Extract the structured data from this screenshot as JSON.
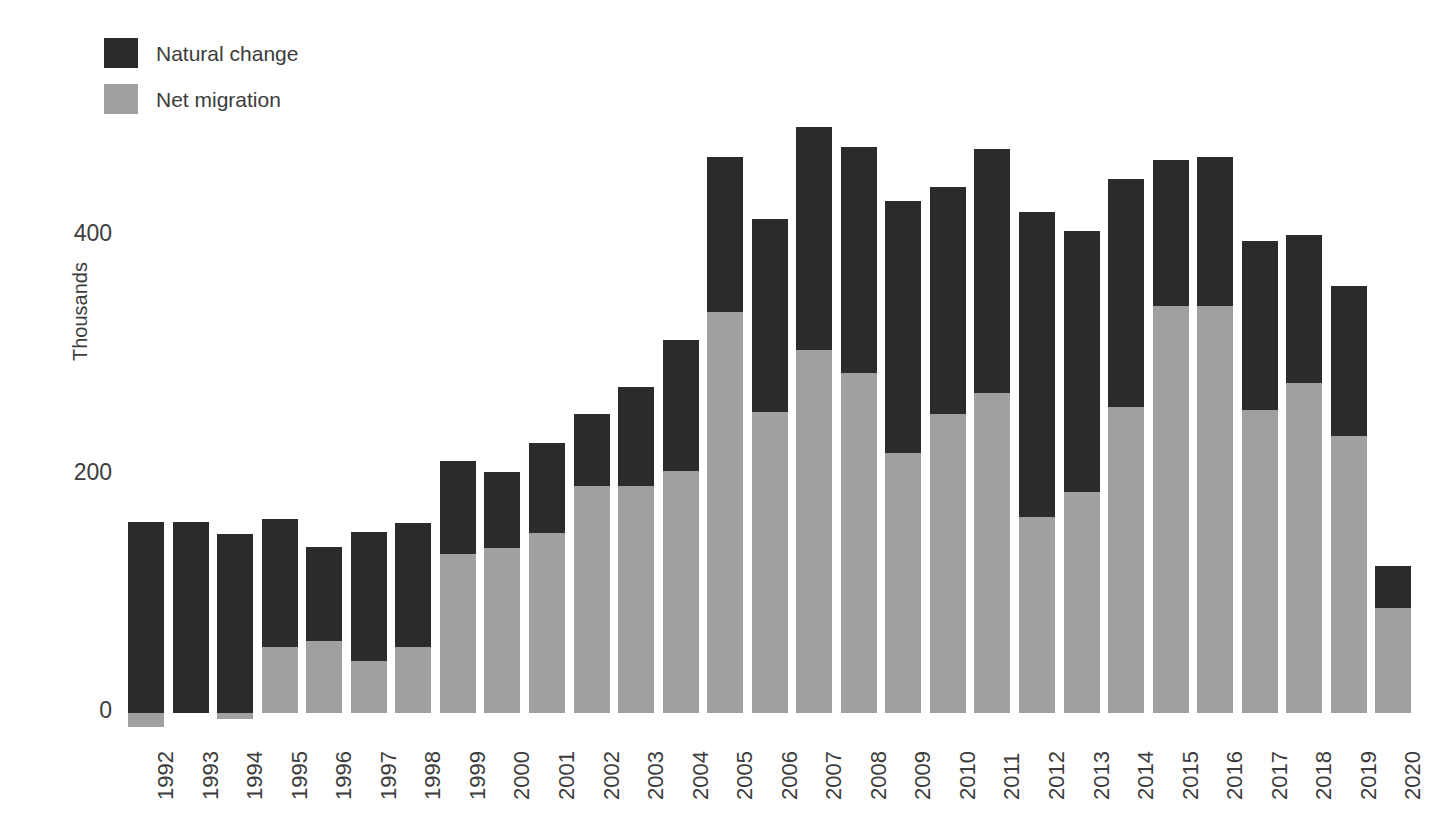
{
  "legend": {
    "position": "top-left",
    "items": [
      {
        "label": "Natural change",
        "color": "#2b2b2b",
        "key": "natural_change"
      },
      {
        "label": "Net migration",
        "color": "#a0a0a0",
        "key": "net_migration"
      }
    ]
  },
  "axes": {
    "ylabel": "Thousands",
    "yticks": [
      "0",
      "200",
      "400"
    ],
    "ytick_values": [
      0,
      200,
      400
    ],
    "ylim": [
      -20,
      460
    ],
    "grid": false
  },
  "chart_data": {
    "type": "bar",
    "stacked": true,
    "title": "",
    "subtitle": "",
    "xlabel": "",
    "ylabel": "Thousands",
    "ylim": [
      -20,
      460
    ],
    "grid": false,
    "legend_position": "top-left",
    "categories": [
      "1992",
      "1993",
      "1994",
      "1995",
      "1996",
      "1997",
      "1998",
      "1999",
      "2000",
      "2001",
      "2002",
      "2003",
      "2004",
      "2005",
      "2006",
      "2007",
      "2008",
      "2009",
      "2010",
      "2011",
      "2012",
      "2013",
      "2014",
      "2015",
      "2016",
      "2017",
      "2018",
      "2019",
      "2020"
    ],
    "series": [
      {
        "name": "Net migration",
        "color": "#a0a0a0",
        "values": [
          -12,
          0,
          -5,
          55,
          60,
          44,
          55,
          133,
          138,
          151,
          190,
          190,
          203,
          336,
          252,
          304,
          285,
          218,
          251,
          268,
          164,
          185,
          257,
          341,
          341,
          254,
          277,
          232,
          88
        ]
      },
      {
        "name": "Natural change",
        "color": "#2b2b2b",
        "values": [
          160,
          160,
          150,
          108,
          79,
          108,
          104,
          78,
          64,
          75,
          61,
          83,
          110,
          130,
          162,
          187,
          190,
          211,
          190,
          205,
          256,
          219,
          191,
          123,
          125,
          142,
          124,
          126,
          35
        ]
      }
    ],
    "totals": [
      148,
      160,
      145,
      163,
      139,
      152,
      159,
      211,
      202,
      226,
      251,
      273,
      313,
      466,
      414,
      491,
      475,
      429,
      441,
      473,
      420,
      404,
      448,
      464,
      466,
      396,
      401,
      358,
      123
    ]
  },
  "colors": {
    "natural_change": "#2b2b2b",
    "net_migration": "#a0a0a0",
    "text": "#3c3c3c",
    "background": "#ffffff"
  }
}
